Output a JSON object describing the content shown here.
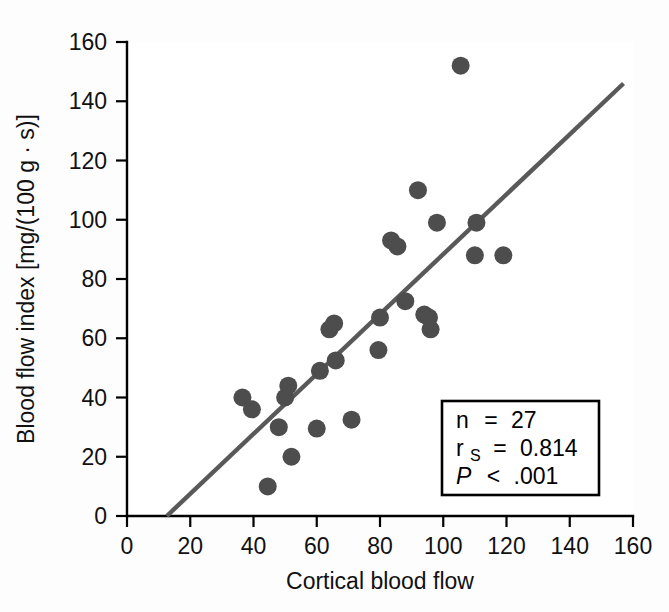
{
  "figure": {
    "background_color": "#fdfdfd",
    "plot_background_color": "#ffffff"
  },
  "chart_data": {
    "type": "scatter",
    "title": "",
    "subtitle": "",
    "xlabel": "Cortical blood flow",
    "ylabel": "Blood flow index [mg/(100 g · s)]",
    "xlim": [
      0,
      160
    ],
    "ylim": [
      0,
      160
    ],
    "xticks": [
      0,
      20,
      40,
      60,
      80,
      100,
      120,
      140,
      160
    ],
    "yticks": [
      0,
      20,
      40,
      60,
      80,
      100,
      120,
      140,
      160
    ],
    "xticklabels": [
      "0",
      "20",
      "40",
      "60",
      "80",
      "100",
      "120",
      "140",
      "160"
    ],
    "yticklabels": [
      "0",
      "20",
      "40",
      "60",
      "80",
      "100",
      "120",
      "140",
      "160"
    ],
    "grid": false,
    "legend": false,
    "legend_position": "none",
    "marker_color": "#4d4d4d",
    "marker_size": 9,
    "points": [
      {
        "x": 36.5,
        "y": 40
      },
      {
        "x": 39.5,
        "y": 36
      },
      {
        "x": 44.5,
        "y": 10
      },
      {
        "x": 48,
        "y": 30
      },
      {
        "x": 50,
        "y": 40
      },
      {
        "x": 51,
        "y": 44
      },
      {
        "x": 52,
        "y": 20
      },
      {
        "x": 60,
        "y": 29.5
      },
      {
        "x": 61,
        "y": 49
      },
      {
        "x": 64,
        "y": 63
      },
      {
        "x": 65.5,
        "y": 65
      },
      {
        "x": 66,
        "y": 52.5
      },
      {
        "x": 71,
        "y": 32.5
      },
      {
        "x": 79.5,
        "y": 56
      },
      {
        "x": 80,
        "y": 67
      },
      {
        "x": 83.5,
        "y": 93
      },
      {
        "x": 85.5,
        "y": 91
      },
      {
        "x": 88,
        "y": 72.5
      },
      {
        "x": 92,
        "y": 110
      },
      {
        "x": 94,
        "y": 68
      },
      {
        "x": 95.5,
        "y": 67
      },
      {
        "x": 96,
        "y": 63
      },
      {
        "x": 98,
        "y": 99
      },
      {
        "x": 105.5,
        "y": 152
      },
      {
        "x": 110.5,
        "y": 99
      },
      {
        "x": 110,
        "y": 88
      },
      {
        "x": 119,
        "y": 88
      }
    ],
    "fit_line": {
      "color": "#595959",
      "x_start": 12.6,
      "y_start": 0,
      "x_end": 157,
      "y_end": 146,
      "width": 4.4
    },
    "annotation_box": {
      "lines": [
        {
          "label": "n",
          "operator": "=",
          "value": "27",
          "subscript": "",
          "italic": false
        },
        {
          "label": "r",
          "operator": "=",
          "value": "0.814",
          "subscript": "S",
          "italic": false
        },
        {
          "label": "P",
          "operator": "<",
          "value": ".001",
          "subscript": "",
          "italic": true
        }
      ],
      "border_color": "#000000",
      "background_color": "#ffffff"
    }
  },
  "stats": {
    "n_label": "n",
    "n_op": "=",
    "n_value": "27",
    "r_label": "r",
    "r_sub": "S",
    "r_op": "=",
    "r_value": "0.814",
    "p_label": "P",
    "p_op": "<",
    "p_value": ".001"
  },
  "axes": {
    "x_title": "Cortical blood flow",
    "y_title": "Blood flow index [mg/(100 g · s)]",
    "x_tick_0": "0",
    "x_tick_1": "20",
    "x_tick_2": "40",
    "x_tick_3": "60",
    "x_tick_4": "80",
    "x_tick_5": "100",
    "x_tick_6": "120",
    "x_tick_7": "140",
    "x_tick_8": "160",
    "y_tick_0": "0",
    "y_tick_1": "20",
    "y_tick_2": "40",
    "y_tick_3": "60",
    "y_tick_4": "80",
    "y_tick_5": "100",
    "y_tick_6": "120",
    "y_tick_7": "140",
    "y_tick_8": "160"
  }
}
